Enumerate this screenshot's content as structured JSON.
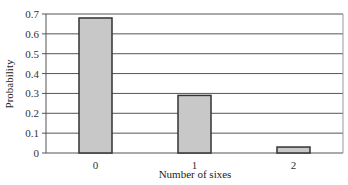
{
  "chart_data": {
    "type": "bar",
    "title": "",
    "xlabel": "Number of sixes",
    "ylabel": "Probability",
    "categories": [
      "0",
      "1",
      "2"
    ],
    "values": [
      0.68,
      0.29,
      0.03
    ],
    "ylim": [
      0,
      0.7
    ],
    "yticks": [
      "0",
      "0.1",
      "0.2",
      "0.3",
      "0.4",
      "0.5",
      "0.6",
      "0.7"
    ],
    "grid": true,
    "legend": null,
    "colors": {
      "bar_fill": "#c8c8c8",
      "bar_edge": "#333333",
      "grid": "#555555"
    }
  }
}
